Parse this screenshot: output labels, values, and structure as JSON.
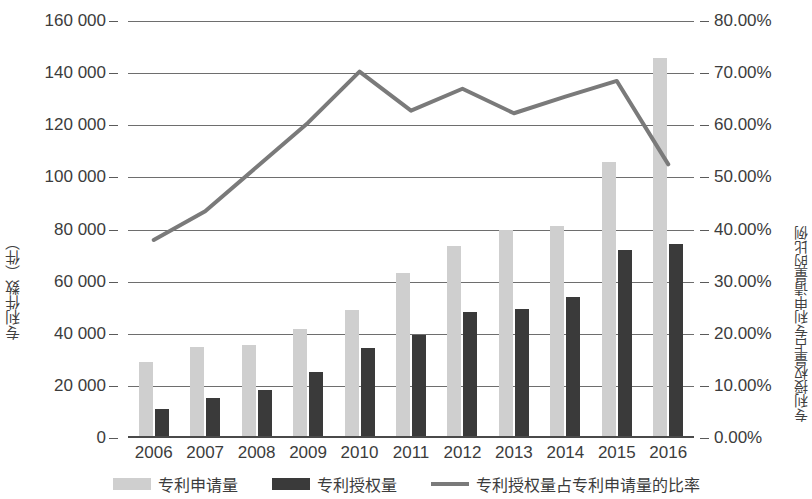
{
  "chart_data": {
    "type": "bar",
    "title": "",
    "categories": [
      "2006",
      "2007",
      "2008",
      "2009",
      "2010",
      "2011",
      "2012",
      "2013",
      "2014",
      "2015",
      "2016"
    ],
    "series": [
      {
        "name": "专利申请量",
        "type": "bar",
        "axis": "left",
        "color": "#cfcfcf",
        "values": [
          29000,
          35000,
          35500,
          42000,
          49000,
          63500,
          73500,
          80000,
          81500,
          106000,
          146000
        ]
      },
      {
        "name": "专利授权量",
        "type": "bar",
        "axis": "left",
        "color": "#3a3a3a",
        "values": [
          11000,
          15500,
          18500,
          25500,
          34500,
          39500,
          48500,
          49500,
          54000,
          72000,
          74500
        ]
      },
      {
        "name": "专利授权量占专利申请量的比率",
        "type": "line",
        "axis": "right",
        "color": "#7a7a7a",
        "values": [
          38.0,
          43.5,
          52.0,
          60.5,
          70.3,
          62.8,
          67.0,
          62.3,
          65.5,
          68.5,
          52.5
        ]
      }
    ],
    "xlabel": "",
    "ylabel_left": "专利件数（件）",
    "ylabel_right": "专利授权量占专利申请量的比例",
    "ylim_left": [
      0,
      160000
    ],
    "ylim_right": [
      0,
      80
    ],
    "yticks_left": [
      "0",
      "20 000",
      "40 000",
      "60 000",
      "80 000",
      "100 000",
      "120 000",
      "140 000",
      "160 000"
    ],
    "yticks_left_values": [
      0,
      20000,
      40000,
      60000,
      80000,
      100000,
      120000,
      140000,
      160000
    ],
    "yticks_right": [
      "0.00%",
      "10.00%",
      "20.00%",
      "30.00%",
      "40.00%",
      "50.00%",
      "60.00%",
      "70.00%",
      "80.00%"
    ],
    "yticks_right_values": [
      0,
      10,
      20,
      30,
      40,
      50,
      60,
      70,
      80
    ],
    "grid": true,
    "legend_position": "bottom"
  },
  "legend": {
    "items": [
      {
        "label": "专利申请量",
        "marker": "bar-swatch-light",
        "color": "#cfcfcf"
      },
      {
        "label": "专利授权量",
        "marker": "bar-swatch-dark",
        "color": "#3a3a3a"
      },
      {
        "label": "专利授权量占专利申请量的比率",
        "marker": "line-swatch",
        "color": "#7a7a7a"
      }
    ]
  }
}
